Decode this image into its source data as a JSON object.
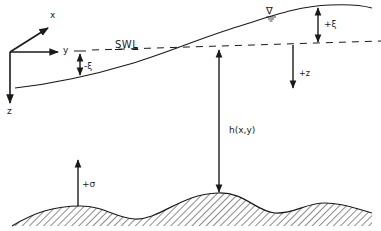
{
  "diagram": {
    "colors": {
      "ink": "#1a1a1a",
      "background": "#ffffff"
    },
    "axes": {
      "x_label": "x",
      "y_label": "y",
      "z_label": "z"
    },
    "swl": {
      "label": "SWL",
      "first": "S",
      "middle": "W",
      "last": "L"
    },
    "labels": {
      "neg_xi": "-ξ",
      "pos_xi": "+ξ",
      "pos_z": "+z",
      "depth": "h(x,y)",
      "pos_sigma": "+σ"
    },
    "symbols": {
      "water_level": "∇"
    }
  }
}
